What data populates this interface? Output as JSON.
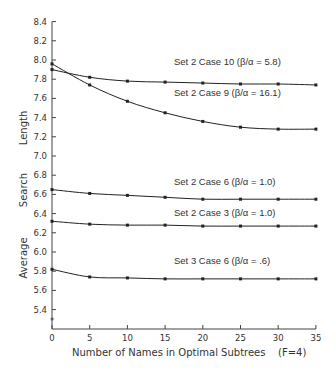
{
  "chart_data": {
    "type": "line",
    "title": "",
    "xlabel": "Number of Names in Optimal Subtrees",
    "xlabel_note": "(F=4)",
    "ylabel": "Average Search Length",
    "xlim": [
      0,
      35
    ],
    "ylim": [
      5.25,
      8.4
    ],
    "x_ticks": [
      0,
      5,
      10,
      15,
      20,
      25,
      30,
      35
    ],
    "y_ticks": [
      5.4,
      5.6,
      5.8,
      6.0,
      6.2,
      6.4,
      6.6,
      6.8,
      7.0,
      7.2,
      7.4,
      7.6,
      7.8,
      8.0,
      8.2,
      8.4
    ],
    "grid": false,
    "legend": "inline labels",
    "x": [
      0,
      5,
      10,
      15,
      20,
      25,
      30,
      35
    ],
    "series": [
      {
        "name": "Set 2 Case 10",
        "ratio_label": "(β/α = 5.8)",
        "values": [
          7.9,
          7.82,
          7.78,
          7.77,
          7.76,
          7.75,
          7.75,
          7.74
        ]
      },
      {
        "name": "Set 2 Case 9",
        "ratio_label": "(β/α = 16.1)",
        "values": [
          7.96,
          7.74,
          7.57,
          7.45,
          7.36,
          7.3,
          7.28,
          7.28
        ]
      },
      {
        "name": "Set 2 Case 6",
        "ratio_label": "(β/α = 1.0)",
        "values": [
          6.65,
          6.61,
          6.59,
          6.57,
          6.55,
          6.55,
          6.55,
          6.55
        ]
      },
      {
        "name": "Set 2 Case 3",
        "ratio_label": "(β/α = 1.0)",
        "values": [
          6.32,
          6.29,
          6.28,
          6.28,
          6.27,
          6.27,
          6.27,
          6.27
        ]
      },
      {
        "name": "Set 3 Case 6",
        "ratio_label": "(β/α = .6)",
        "values": [
          5.82,
          5.74,
          5.73,
          5.72,
          5.72,
          5.72,
          5.72,
          5.72
        ]
      }
    ],
    "annotations": [
      {
        "type": "asterisk-marker",
        "x": 0,
        "y": 5.28
      }
    ]
  },
  "labels": {
    "ylabel_words": [
      "Average",
      "Search",
      "Length"
    ],
    "xlabel": "Number of Names in Optimal Subtrees",
    "xlabel_note": "(F=4)"
  },
  "colors": {
    "line": "#222222",
    "axis": "#444444",
    "text": "#333333",
    "background": "#ffffff"
  }
}
